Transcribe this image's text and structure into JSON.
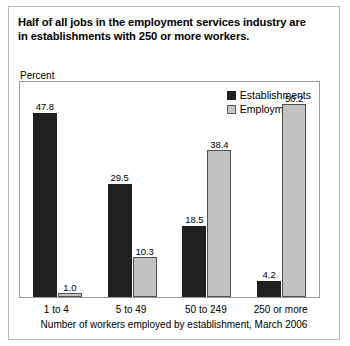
{
  "title": {
    "line1": "Half of all jobs in the employment services industry are",
    "line2": "in establishments with 250 or more workers."
  },
  "axis": {
    "y_label": "Percent",
    "x_caption": "Number of workers employed by establishment, March 2006"
  },
  "legend": {
    "items": [
      {
        "label": "Establishments",
        "color": "#211f20"
      },
      {
        "label": "Employment",
        "color": "#c2c2c2"
      }
    ]
  },
  "chart_data": {
    "type": "bar",
    "title": "Half of all jobs in the employment services industry are in establishments with 250 or more workers.",
    "xlabel": "Number of workers employed by establishment, March 2006",
    "ylabel": "Percent",
    "categories": [
      "1 to 4",
      "5 to 49",
      "50 to 249",
      "250 or more"
    ],
    "series": [
      {
        "name": "Establishments",
        "values": [
          47.8,
          29.5,
          18.5,
          4.2
        ],
        "color": "#211f20"
      },
      {
        "name": "Employment",
        "values": [
          1.0,
          10.3,
          38.4,
          50.2
        ],
        "color": "#c2c2c2"
      }
    ],
    "ylim": [
      0,
      56
    ],
    "grid": false,
    "legend_position": "top-right",
    "value_labels": true
  }
}
